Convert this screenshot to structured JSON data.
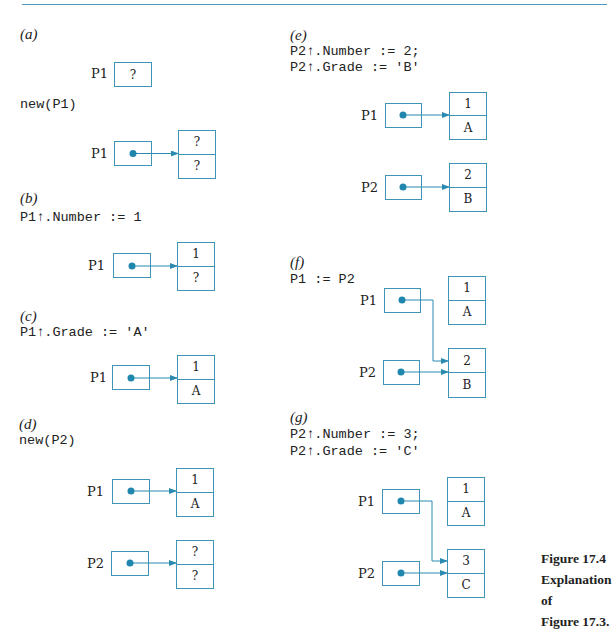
{
  "figure": {
    "caption_lines": [
      "Figure 17.4",
      "Explanation of",
      "Figure 17.3."
    ],
    "accent_color": "#3d94b6"
  },
  "panels": {
    "a": {
      "label": "(a)",
      "var1": "P1",
      "var1_value": "?",
      "code": "new(P1)",
      "var2": "P1",
      "record": {
        "number": "?",
        "grade": "?"
      }
    },
    "b": {
      "label": "(b)",
      "code": "P1↑.Number := 1",
      "var": "P1",
      "record": {
        "number": "1",
        "grade": "?"
      }
    },
    "c": {
      "label": "(c)",
      "code": "P1↑.Grade := 'A'",
      "var": "P1",
      "record": {
        "number": "1",
        "grade": "A"
      }
    },
    "d": {
      "label": "(d)",
      "code": "new(P2)",
      "var1": "P1",
      "record1": {
        "number": "1",
        "grade": "A"
      },
      "var2": "P2",
      "record2": {
        "number": "?",
        "grade": "?"
      }
    },
    "e": {
      "label": "(e)",
      "code_lines": [
        "P2↑.Number := 2;",
        "P2↑.Grade := 'B'"
      ],
      "var1": "P1",
      "record1": {
        "number": "1",
        "grade": "A"
      },
      "var2": "P2",
      "record2": {
        "number": "2",
        "grade": "B"
      }
    },
    "f": {
      "label": "(f)",
      "code": "P1 := P2",
      "var1": "P1",
      "record1": {
        "number": "1",
        "grade": "A"
      },
      "var2": "P2",
      "record2": {
        "number": "2",
        "grade": "B"
      }
    },
    "g": {
      "label": "(g)",
      "code_lines": [
        "P2↑.Number := 3;",
        "P2↑.Grade := 'C'"
      ],
      "var1": "P1",
      "record1": {
        "number": "1",
        "grade": "A"
      },
      "var2": "P2",
      "record2": {
        "number": "3",
        "grade": "C"
      }
    }
  }
}
